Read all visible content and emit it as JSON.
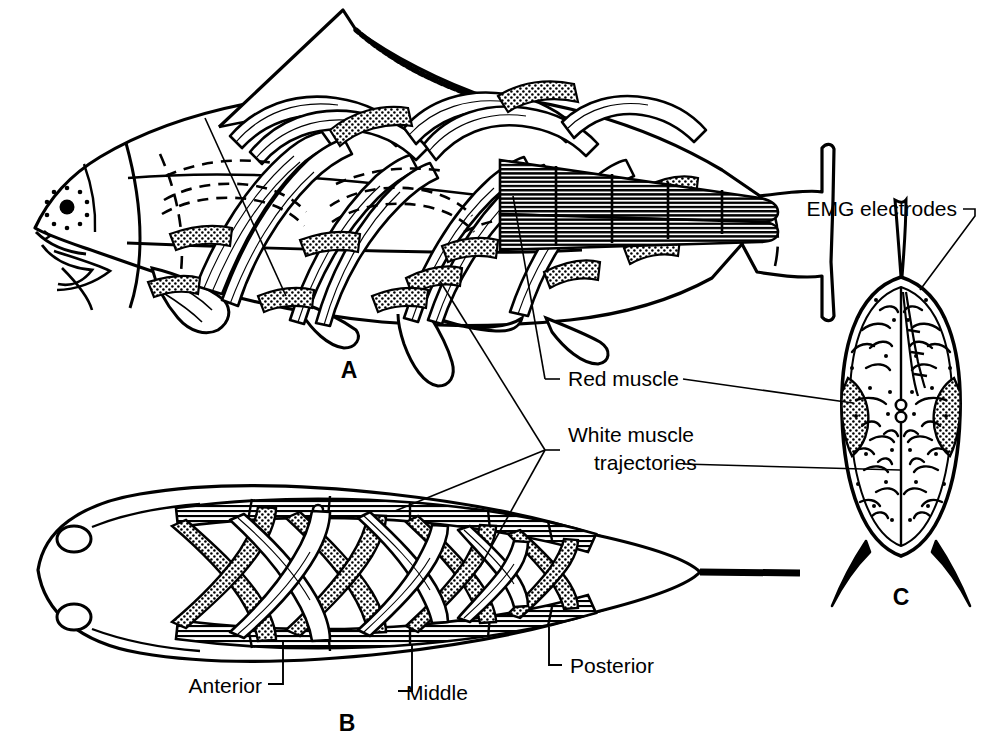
{
  "figure": {
    "background_color": "#ffffff",
    "ink_color": "#000000",
    "width": 999,
    "height": 746
  },
  "panels": [
    {
      "id": "A",
      "label": "A",
      "view": "lateral whole-body view of fish with muscle trajectories"
    },
    {
      "id": "B",
      "label": "B",
      "view": "dorsal view of fish showing red muscle bands and white muscle trajectories"
    },
    {
      "id": "C",
      "label": "C",
      "view": "transverse cross-section with EMG electrodes"
    }
  ],
  "labels": {
    "emg_electrodes": "EMG electrodes",
    "red_muscle": "Red muscle",
    "white_muscle_line1": "White muscle",
    "white_muscle_line2": "trajectories",
    "anterior": "Anterior",
    "middle": "Middle",
    "posterior": "Posterior"
  },
  "panel_labels": {
    "a": "A",
    "b": "B",
    "c": "C"
  }
}
